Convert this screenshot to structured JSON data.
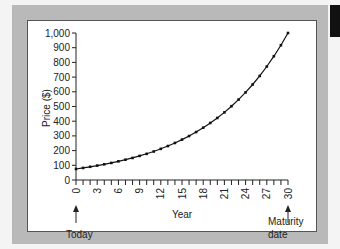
{
  "chart_data": {
    "type": "line",
    "title": "",
    "xlabel": "Year",
    "ylabel": "Price ($)",
    "xlim": [
      0,
      30
    ],
    "ylim": [
      0,
      1000
    ],
    "x_ticks": [
      "0",
      "3",
      "6",
      "9",
      "12",
      "15",
      "18",
      "21",
      "24",
      "27",
      "30"
    ],
    "y_ticks": [
      "0",
      "100",
      "200",
      "300",
      "400",
      "500",
      "600",
      "700",
      "800",
      "900",
      "1,000"
    ],
    "grid": false,
    "legend": null,
    "series": [
      {
        "name": "Zero-coupon bond price",
        "x": [
          0,
          1,
          2,
          3,
          4,
          5,
          6,
          7,
          8,
          9,
          10,
          11,
          12,
          13,
          14,
          15,
          16,
          17,
          18,
          19,
          20,
          21,
          22,
          23,
          24,
          25,
          26,
          27,
          28,
          29,
          30
        ],
        "values": [
          75,
          82,
          90,
          98,
          107,
          116,
          127,
          138,
          150,
          164,
          178,
          194,
          212,
          231,
          252,
          275,
          299,
          326,
          356,
          388,
          422,
          460,
          502,
          547,
          596,
          650,
          708,
          772,
          842,
          917,
          1000
        ]
      }
    ],
    "annotations": [
      {
        "text": "Today",
        "x": 0
      },
      {
        "text": "Maturity date",
        "x": 30
      }
    ]
  },
  "labels": {
    "ylabel": "Price ($)",
    "xlabel": "Year",
    "today": "Today",
    "maturity_line1": "Maturity",
    "maturity_line2": "date"
  }
}
